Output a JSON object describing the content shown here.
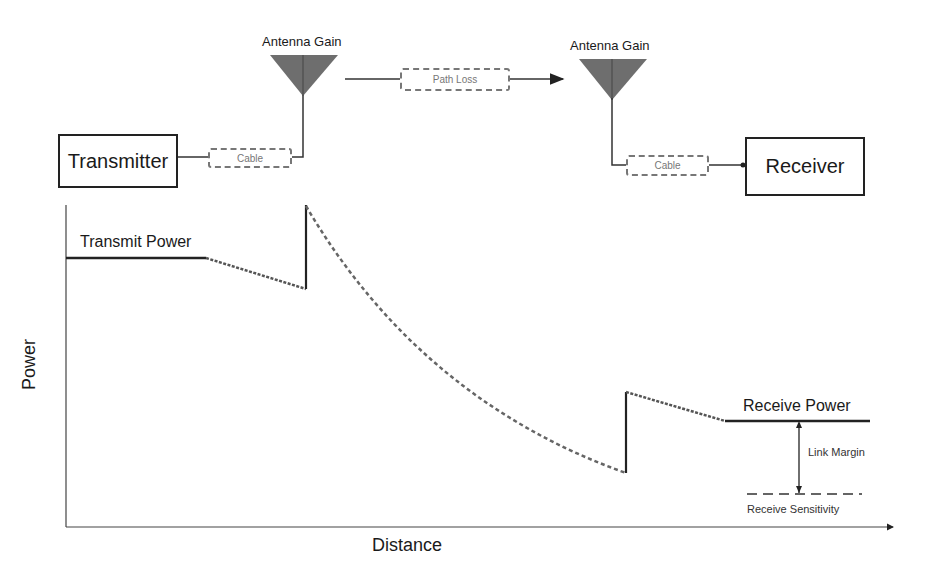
{
  "diagram": {
    "type": "rf_link_budget",
    "top_chain": {
      "transmitter": {
        "label": "Transmitter"
      },
      "tx_cable": {
        "label": "Cable"
      },
      "tx_antenna": {
        "label": "Antenna Gain"
      },
      "path_loss": {
        "label": "Path Loss"
      },
      "rx_antenna": {
        "label": "Antenna Gain"
      },
      "rx_cable": {
        "label": "Cable"
      },
      "receiver": {
        "label": "Receiver"
      }
    },
    "plot": {
      "ylabel": "Power",
      "xlabel": "Distance",
      "annotations": {
        "transmit_power": "Transmit Power",
        "receive_power": "Receive Power",
        "link_margin": "Link Margin",
        "receive_sensitivity": "Receive Sensitivity"
      }
    },
    "colors": {
      "line": "#222222",
      "dashed_curve": "#666666",
      "antenna_fill": "#6e6e6e",
      "dashed_box": "#777777"
    }
  }
}
